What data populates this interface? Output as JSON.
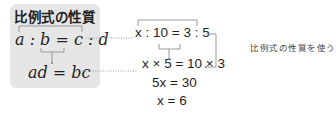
{
  "box": {
    "title": "比例式の性質",
    "equation": "a : b = c : d",
    "result": "ad = bc"
  },
  "example": {
    "step1": "x : 10 = 3 : 5",
    "step2": "x × 5 = 10 × 3",
    "step3": "5x = 30",
    "step4": "x = 6",
    "annotation": "比例式の性質を使う"
  },
  "colors": {
    "box_bg": "#e6e6e6",
    "line": "#999999",
    "text": "#1f1f1f"
  }
}
